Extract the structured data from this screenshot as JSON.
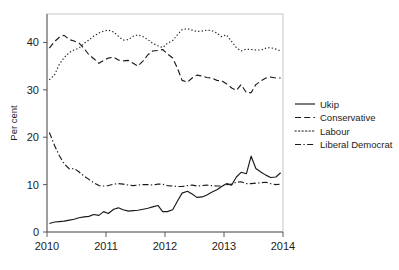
{
  "chart_data": {
    "type": "line",
    "title": "",
    "xlabel": "",
    "ylabel": "Per cent",
    "xlim": [
      2010.0,
      2014.0
    ],
    "ylim": [
      0,
      46
    ],
    "grid": false,
    "legend_position": "right",
    "x_ticks": [
      "2010",
      "2011",
      "2012",
      "2013",
      "2014"
    ],
    "x_tick_values": [
      2010,
      2011,
      2012,
      2013,
      2014
    ],
    "y_ticks": [
      "0",
      "10",
      "20",
      "30",
      "40"
    ],
    "y_tick_values": [
      0,
      10,
      20,
      30,
      40
    ],
    "x": [
      2010.04,
      2010.13,
      2010.21,
      2010.29,
      2010.38,
      2010.46,
      2010.54,
      2010.63,
      2010.71,
      2010.79,
      2010.88,
      2010.96,
      2011.04,
      2011.13,
      2011.21,
      2011.29,
      2011.38,
      2011.46,
      2011.54,
      2011.63,
      2011.71,
      2011.79,
      2011.88,
      2011.96,
      2012.04,
      2012.13,
      2012.21,
      2012.29,
      2012.38,
      2012.46,
      2012.54,
      2012.63,
      2012.71,
      2012.79,
      2012.88,
      2012.96,
      2013.04,
      2013.13,
      2013.21,
      2013.29,
      2013.38,
      2013.46,
      2013.54,
      2013.63,
      2013.71,
      2013.79,
      2013.88,
      2013.96
    ],
    "series": [
      {
        "name": "Ukip",
        "style": "solid",
        "color": "#1a1a1a",
        "values": [
          1.8,
          2.1,
          2.2,
          2.3,
          2.5,
          2.7,
          3.0,
          3.2,
          3.3,
          3.7,
          3.5,
          4.3,
          3.9,
          4.8,
          5.1,
          4.7,
          4.4,
          4.5,
          4.6,
          4.8,
          5.0,
          5.3,
          5.6,
          4.3,
          4.3,
          4.7,
          6.5,
          8.2,
          8.6,
          8.0,
          7.3,
          7.4,
          7.8,
          8.4,
          8.9,
          9.6,
          10.2,
          9.9,
          11.6,
          12.6,
          12.3,
          16.0,
          13.4,
          12.6,
          12.0,
          11.5,
          11.6,
          12.5
        ]
      },
      {
        "name": "Conservative",
        "style": "dashed",
        "color": "#1a1a1a",
        "values": [
          38.8,
          40.2,
          41.1,
          41.5,
          40.6,
          40.3,
          39.9,
          38.7,
          37.4,
          36.6,
          35.6,
          36.2,
          36.7,
          36.9,
          36.3,
          36.1,
          36.2,
          35.6,
          35.0,
          36.1,
          37.4,
          38.2,
          38.3,
          38.5,
          37.6,
          36.7,
          34.6,
          32.0,
          31.6,
          32.5,
          33.1,
          32.9,
          32.6,
          32.5,
          32.0,
          31.9,
          31.3,
          30.4,
          29.9,
          31.1,
          29.4,
          29.4,
          31.1,
          31.9,
          32.5,
          32.7,
          32.5,
          32.5
        ]
      },
      {
        "name": "Labour",
        "style": "dotted",
        "color": "#1a1a1a",
        "values": [
          32.1,
          33.2,
          35.4,
          36.8,
          37.9,
          38.4,
          38.8,
          39.8,
          40.5,
          41.3,
          42.0,
          42.4,
          42.6,
          42.2,
          41.3,
          40.5,
          40.6,
          41.3,
          41.6,
          41.2,
          40.6,
          39.8,
          39.3,
          38.9,
          39.8,
          40.4,
          41.6,
          42.7,
          42.9,
          42.6,
          42.3,
          42.4,
          42.6,
          42.5,
          42.0,
          41.2,
          41.6,
          40.2,
          38.9,
          38.2,
          38.6,
          38.5,
          38.4,
          38.4,
          38.8,
          38.9,
          38.6,
          38.2
        ]
      },
      {
        "name": "Liberal Democrat",
        "style": "dashdot",
        "color": "#1a1a1a",
        "values": [
          21.0,
          18.2,
          16.1,
          14.4,
          13.3,
          13.4,
          12.7,
          11.8,
          11.1,
          10.4,
          9.8,
          9.7,
          9.8,
          10.1,
          10.2,
          10.1,
          9.9,
          9.8,
          9.9,
          10.0,
          10.0,
          9.9,
          10.1,
          10.1,
          9.8,
          9.7,
          9.6,
          9.6,
          9.8,
          9.9,
          9.7,
          9.8,
          9.9,
          9.8,
          9.7,
          9.7,
          10.0,
          10.1,
          10.5,
          10.6,
          10.2,
          10.2,
          10.3,
          10.4,
          10.5,
          10.2,
          10.0,
          10.1
        ]
      }
    ]
  },
  "legend": {
    "items": [
      {
        "label": "Ukip",
        "style": "solid"
      },
      {
        "label": "Conservative",
        "style": "dashed"
      },
      {
        "label": "Labour",
        "style": "dotted"
      },
      {
        "label": "Liberal Democrat",
        "style": "dashdot"
      }
    ]
  }
}
